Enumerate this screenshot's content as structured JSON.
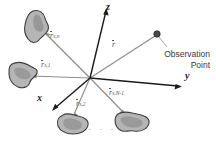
{
  "figure": {
    "background_color": "#ffffff",
    "width": 216,
    "height": 146
  },
  "axes": {
    "z": {
      "label": "z",
      "x": 108,
      "y": 3
    },
    "y": {
      "label": "y",
      "x": 186,
      "y": 74
    },
    "x": {
      "label": "x",
      "x": 38,
      "y": 94
    },
    "origin": {
      "x": 90,
      "y": 78
    },
    "color": "#1a1a1a"
  },
  "vectors": [
    {
      "name": "r-s-n",
      "symbol": "r",
      "subscript": "s,n",
      "label": "r̄s,n",
      "x": 50,
      "y": 33,
      "color": "#6b6b6b"
    },
    {
      "name": "r-s-1",
      "symbol": "r",
      "subscript": "s,1",
      "label": "r̄s,1",
      "x": 42,
      "y": 62,
      "color": "#6b6b6b"
    },
    {
      "name": "r-observation",
      "symbol": "r",
      "subscript": "",
      "label": "r̄",
      "x": 112,
      "y": 42,
      "color": "#6b6b6b"
    },
    {
      "name": "r-s-2",
      "symbol": "r",
      "subscript": "s,2",
      "label": "r̄s,2",
      "x": 77,
      "y": 101,
      "color": "#6b6b6b"
    },
    {
      "name": "r-s-N-1",
      "symbol": "r",
      "subscript": "s,N-1",
      "label": "r̄s,N-1",
      "x": 110,
      "y": 90,
      "color": "#6b6b6b"
    }
  ],
  "observation_point": {
    "label_line1": "Observation",
    "label_line2": "Point",
    "dot_x": 157,
    "dot_y": 34,
    "dot_color": "#4a4a4a",
    "label_x": 208,
    "label_y": 56
  },
  "scatterers": [
    {
      "name": "scatterer-n",
      "cx": 37,
      "cy": 27
    },
    {
      "name": "scatterer-1",
      "cx": 24,
      "cy": 75
    },
    {
      "name": "scatterer-2",
      "cx": 73,
      "cy": 125
    },
    {
      "name": "scatterer-N-1",
      "cx": 131,
      "cy": 122
    }
  ],
  "ellipsis": {
    "text": "·  ·  ·",
    "x": 96,
    "y": 128
  },
  "colors": {
    "blob_fill": "#b5b5b5",
    "blob_fill_light": "#c9c9c9",
    "blob_stroke": "#3d3d3d",
    "vector_line": "#8e8e8e",
    "axis_line": "#1a1a1a",
    "text": "#2b2b2b",
    "leader_line": "#9a9a9a"
  }
}
